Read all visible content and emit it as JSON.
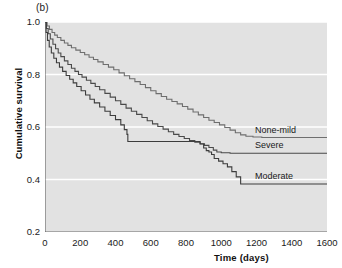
{
  "panel": {
    "label": "(b)"
  },
  "axes": {
    "xlabel": "Time (days)",
    "ylabel": "Cumulative survival",
    "xticks": [
      "0",
      "200",
      "400",
      "600",
      "800",
      "1000",
      "1200",
      "1400",
      "1600"
    ],
    "yticks": [
      "1.0",
      "0.8",
      "0.6",
      "0.4",
      "0.2"
    ]
  },
  "colors": {
    "plot_background": "#e2e2e2",
    "gridline": "#ffffff",
    "axis": "#555555",
    "none_mild": "#6e6e6e",
    "severe": "#4a4a4a",
    "moderate": "#3c3c3c",
    "text": "#1a1a1a"
  },
  "chart_data": {
    "type": "line",
    "title": "(b)",
    "xlabel": "Time (days)",
    "ylabel": "Cumulative survival",
    "xlim": [
      0,
      1600
    ],
    "ylim": [
      0.2,
      1.0
    ],
    "xticks": [
      0,
      200,
      400,
      600,
      800,
      1000,
      1200,
      1400,
      1600
    ],
    "yticks": [
      1.0,
      0.8,
      0.6,
      0.4,
      0.2
    ],
    "grid": "horizontal-white",
    "legend": "inline-right-of-curves",
    "series": [
      {
        "name": "None-mild",
        "label": "None-mild",
        "color": "#6e6e6e",
        "final_survival": 0.56,
        "points": [
          [
            0,
            1.0
          ],
          [
            12,
            0.985
          ],
          [
            25,
            0.972
          ],
          [
            40,
            0.96
          ],
          [
            55,
            0.95
          ],
          [
            70,
            0.941
          ],
          [
            90,
            0.93
          ],
          [
            110,
            0.92
          ],
          [
            130,
            0.911
          ],
          [
            150,
            0.902
          ],
          [
            175,
            0.893
          ],
          [
            200,
            0.884
          ],
          [
            225,
            0.875
          ],
          [
            250,
            0.866
          ],
          [
            275,
            0.857
          ],
          [
            300,
            0.848
          ],
          [
            330,
            0.838
          ],
          [
            360,
            0.828
          ],
          [
            390,
            0.818
          ],
          [
            420,
            0.806
          ],
          [
            450,
            0.795
          ],
          [
            480,
            0.784
          ],
          [
            510,
            0.773
          ],
          [
            540,
            0.762
          ],
          [
            570,
            0.75
          ],
          [
            600,
            0.738
          ],
          [
            630,
            0.727
          ],
          [
            660,
            0.716
          ],
          [
            690,
            0.706
          ],
          [
            720,
            0.697
          ],
          [
            750,
            0.688
          ],
          [
            780,
            0.678
          ],
          [
            810,
            0.668
          ],
          [
            840,
            0.657
          ],
          [
            870,
            0.646
          ],
          [
            900,
            0.636
          ],
          [
            930,
            0.626
          ],
          [
            960,
            0.617
          ],
          [
            990,
            0.608
          ],
          [
            1020,
            0.598
          ],
          [
            1050,
            0.588
          ],
          [
            1080,
            0.578
          ],
          [
            1110,
            0.57
          ],
          [
            1140,
            0.565
          ],
          [
            1180,
            0.562
          ],
          [
            1230,
            0.56
          ],
          [
            1300,
            0.56
          ],
          [
            1400,
            0.56
          ],
          [
            1500,
            0.56
          ],
          [
            1600,
            0.56
          ]
        ]
      },
      {
        "name": "Severe",
        "label": "Severe",
        "color": "#4a4a4a",
        "final_survival": 0.5,
        "points": [
          [
            0,
            1.0
          ],
          [
            8,
            0.975
          ],
          [
            18,
            0.955
          ],
          [
            30,
            0.935
          ],
          [
            45,
            0.915
          ],
          [
            60,
            0.898
          ],
          [
            75,
            0.882
          ],
          [
            90,
            0.868
          ],
          [
            110,
            0.852
          ],
          [
            130,
            0.838
          ],
          [
            150,
            0.824
          ],
          [
            170,
            0.812
          ],
          [
            190,
            0.8
          ],
          [
            210,
            0.79
          ],
          [
            235,
            0.778
          ],
          [
            260,
            0.766
          ],
          [
            285,
            0.754
          ],
          [
            310,
            0.742
          ],
          [
            340,
            0.728
          ],
          [
            370,
            0.714
          ],
          [
            400,
            0.7
          ],
          [
            430,
            0.686
          ],
          [
            460,
            0.672
          ],
          [
            490,
            0.66
          ],
          [
            520,
            0.648
          ],
          [
            550,
            0.636
          ],
          [
            580,
            0.624
          ],
          [
            610,
            0.612
          ],
          [
            640,
            0.602
          ],
          [
            670,
            0.592
          ],
          [
            700,
            0.582
          ],
          [
            730,
            0.572
          ],
          [
            760,
            0.564
          ],
          [
            790,
            0.556
          ],
          [
            820,
            0.548
          ],
          [
            850,
            0.542
          ],
          [
            880,
            0.536
          ],
          [
            905,
            0.53
          ],
          [
            930,
            0.522
          ],
          [
            955,
            0.512
          ],
          [
            975,
            0.505
          ],
          [
            1000,
            0.502
          ],
          [
            1050,
            0.5
          ],
          [
            1150,
            0.5
          ],
          [
            1300,
            0.5
          ],
          [
            1450,
            0.5
          ],
          [
            1600,
            0.5
          ]
        ]
      },
      {
        "name": "Moderate",
        "label": "Moderate",
        "color": "#3c3c3c",
        "final_survival": 0.38,
        "points": [
          [
            0,
            1.0
          ],
          [
            6,
            0.96
          ],
          [
            14,
            0.93
          ],
          [
            24,
            0.905
          ],
          [
            36,
            0.882
          ],
          [
            50,
            0.862
          ],
          [
            65,
            0.845
          ],
          [
            82,
            0.828
          ],
          [
            100,
            0.812
          ],
          [
            120,
            0.796
          ],
          [
            140,
            0.782
          ],
          [
            160,
            0.768
          ],
          [
            180,
            0.754
          ],
          [
            205,
            0.738
          ],
          [
            230,
            0.722
          ],
          [
            255,
            0.706
          ],
          [
            280,
            0.692
          ],
          [
            310,
            0.676
          ],
          [
            340,
            0.66
          ],
          [
            370,
            0.644
          ],
          [
            400,
            0.628
          ],
          [
            430,
            0.608
          ],
          [
            450,
            0.59
          ],
          [
            465,
            0.572
          ],
          [
            470,
            0.545
          ],
          [
            520,
            0.545
          ],
          [
            600,
            0.545
          ],
          [
            700,
            0.545
          ],
          [
            800,
            0.545
          ],
          [
            860,
            0.545
          ],
          [
            880,
            0.535
          ],
          [
            900,
            0.52
          ],
          [
            915,
            0.51
          ],
          [
            930,
            0.505
          ],
          [
            945,
            0.495
          ],
          [
            960,
            0.48
          ],
          [
            985,
            0.47
          ],
          [
            1010,
            0.46
          ],
          [
            1035,
            0.448
          ],
          [
            1060,
            0.43
          ],
          [
            1085,
            0.41
          ],
          [
            1110,
            0.383
          ],
          [
            1160,
            0.383
          ],
          [
            1250,
            0.383
          ],
          [
            1400,
            0.383
          ],
          [
            1600,
            0.383
          ]
        ]
      }
    ]
  }
}
